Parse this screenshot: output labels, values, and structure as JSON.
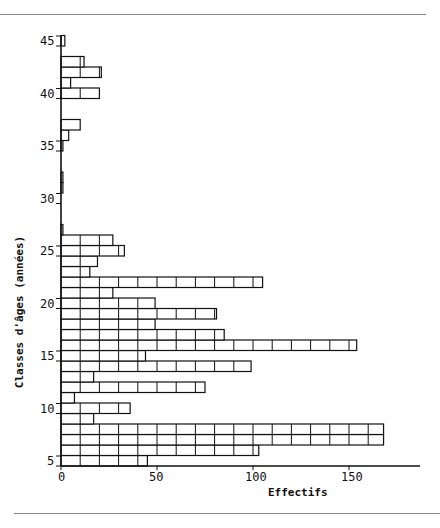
{
  "chart_data": {
    "type": "bar",
    "orientation": "horizontal",
    "title": "",
    "xlabel": "Effectifs",
    "ylabel": "Classes d'âges (années)",
    "xlim": [
      0,
      175
    ],
    "ylim": [
      5,
      46
    ],
    "x_ticks": [
      0,
      50,
      100,
      150
    ],
    "y_ticks": [
      5,
      10,
      15,
      20,
      25,
      30,
      35,
      40,
      45
    ],
    "grid": false,
    "legend": null,
    "bin_width_years": 1,
    "categories": [
      "5",
      "6",
      "7",
      "8",
      "9",
      "10",
      "11",
      "12",
      "13",
      "14",
      "15",
      "16",
      "17",
      "18",
      "19",
      "20",
      "21",
      "22",
      "23",
      "24",
      "25",
      "26",
      "27",
      "28",
      "29",
      "30",
      "31",
      "32",
      "33",
      "34",
      "35",
      "36",
      "37",
      "38",
      "39",
      "40",
      "41",
      "42",
      "43",
      "44",
      "45"
    ],
    "values": [
      45,
      103,
      168,
      168,
      17,
      36,
      7,
      75,
      17,
      99,
      44,
      154,
      85,
      49,
      81,
      49,
      27,
      105,
      15,
      19,
      33,
      27,
      1,
      0,
      0,
      0,
      1,
      1,
      0,
      0,
      1,
      4,
      10,
      0,
      0,
      20,
      5,
      21,
      12,
      0,
      2
    ]
  },
  "labels": {
    "x_axis_title": "Effectifs",
    "y_axis_title": "Classes d'âges (années)"
  }
}
